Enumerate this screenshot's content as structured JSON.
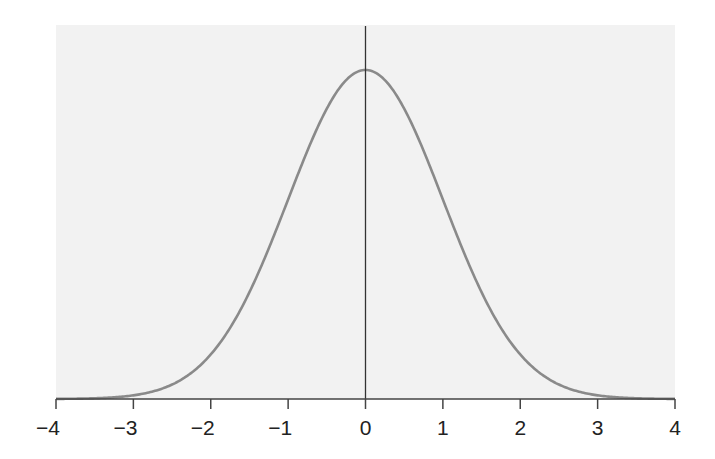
{
  "chart_data": {
    "type": "line",
    "title": "",
    "subtitle": "",
    "xlabel": "",
    "ylabel": "",
    "xlim": [
      -4,
      4
    ],
    "ylim": [
      0,
      0.4
    ],
    "grid": false,
    "legend": null,
    "x_ticks": [
      -4,
      -3,
      -2,
      -1,
      0,
      1,
      2,
      3,
      4
    ],
    "x_tick_labels": [
      "−4",
      "−3",
      "−2",
      "−1",
      "0",
      "1",
      "2",
      "3",
      "4"
    ],
    "series": [
      {
        "name": "standard normal density",
        "color": "#8a8a8a",
        "x": [
          -4,
          -3.5,
          -3,
          -2.5,
          -2,
          -1.5,
          -1,
          -0.5,
          0,
          0.5,
          1,
          1.5,
          2,
          2.5,
          3,
          3.5,
          4
        ],
        "values": [
          0.0001,
          0.0009,
          0.0044,
          0.0175,
          0.054,
          0.1295,
          0.242,
          0.3521,
          0.3989,
          0.3521,
          0.242,
          0.1295,
          0.054,
          0.0175,
          0.0044,
          0.0009,
          0.0001
        ]
      }
    ],
    "annotations": [
      {
        "type": "vertical-line",
        "x": 0,
        "color": "#333333"
      }
    ]
  },
  "colors": {
    "plot_background": "#f2f2f2",
    "curve": "#8a8a8a",
    "axis": "#444444",
    "mean_line": "#333333"
  }
}
